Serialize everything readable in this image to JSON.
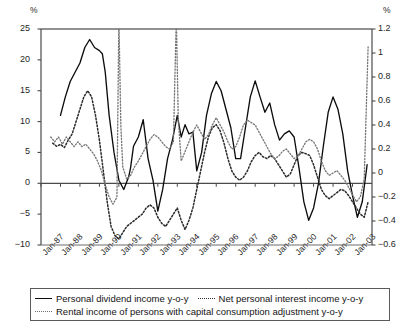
{
  "chart_data": {
    "type": "line",
    "title": "",
    "xlabel": "",
    "ylabel_left": "%",
    "ylabel_right": "%",
    "grid": false,
    "legend_position": "bottom",
    "left_axis": {
      "unit": "%",
      "min": -10,
      "max": 25,
      "step": 5,
      "ticks": [
        "25",
        "20",
        "15",
        "10",
        "5",
        "0",
        "-5",
        "-10"
      ]
    },
    "right_axis": {
      "unit": "%",
      "min": -0.6,
      "max": 1.2,
      "step": 0.2,
      "ticks": [
        "1.2",
        "1",
        "0.8",
        "0.6",
        "0.4",
        "0.2",
        "0",
        "-0.2",
        "-0.4",
        "-0.6"
      ]
    },
    "x_ticks": [
      "Jan-87",
      "Jan-88",
      "Jan-89",
      "Jan-90",
      "Jan-91",
      "Jan-92",
      "Jan-93",
      "Jan-94",
      "Jan-95",
      "Jan-96",
      "Jan-97",
      "Jan-98",
      "Jan-99",
      "Jan-00",
      "Jan-01",
      "Jan-02",
      "Jan-03"
    ],
    "x_range": [
      "Jan-87",
      "Jan-03"
    ],
    "series": [
      {
        "name": "Personal dividend income y-o-y",
        "axis": "left",
        "style": "solid",
        "color": "#0d0d0d",
        "x": [
          1988.0,
          1988.25,
          1988.5,
          1988.75,
          1989.0,
          1989.25,
          1989.5,
          1989.75,
          1990.0,
          1990.15,
          1990.3,
          1990.5,
          1990.75,
          1991.0,
          1991.25,
          1991.5,
          1991.6,
          1991.75,
          1992.0,
          1992.25,
          1992.5,
          1992.75,
          1993.0,
          1993.25,
          1993.5,
          1993.75,
          1994.0,
          1994.2,
          1994.4,
          1994.6,
          1994.8,
          1995.0,
          1995.25,
          1995.5,
          1995.75,
          1996.0,
          1996.25,
          1996.5,
          1996.75,
          1997.0,
          1997.25,
          1997.5,
          1997.75,
          1998.0,
          1998.25,
          1998.5,
          1998.75,
          1999.0,
          1999.25,
          1999.5,
          1999.75,
          2000.0,
          2000.25,
          2000.5,
          2000.75,
          2001.0,
          2001.25,
          2001.5,
          2001.75,
          2002.0,
          2002.25,
          2002.5,
          2002.75,
          2003.0,
          2003.25,
          2003.5,
          2003.75
        ],
        "values": [
          11.0,
          14.0,
          16.5,
          18.0,
          19.5,
          22.0,
          23.3,
          22.0,
          21.5,
          21.0,
          18.0,
          11.0,
          5.0,
          0.5,
          -1.0,
          1.0,
          2.5,
          6.0,
          7.5,
          10.3,
          4.0,
          0.5,
          -4.5,
          -1.0,
          4.0,
          7.0,
          11.0,
          7.5,
          9.5,
          8.0,
          8.3,
          2.0,
          5.0,
          11.0,
          14.5,
          16.5,
          15.0,
          12.0,
          9.0,
          4.0,
          4.0,
          9.0,
          14.0,
          16.6,
          14.0,
          11.5,
          13.0,
          9.5,
          7.0,
          8.0,
          8.5,
          7.5,
          2.5,
          -3.0,
          -6.0,
          -4.0,
          0.0,
          6.0,
          11.5,
          14.0,
          12.0,
          8.0,
          2.0,
          -2.0,
          -5.5,
          -3.0,
          3.0
        ]
      },
      {
        "name": "Net personal interest income y-o-y",
        "axis": "left",
        "style": "dotted-dark",
        "color": "#2b2b2b",
        "x": [
          1987.6,
          1987.8,
          1988.0,
          1988.2,
          1988.4,
          1988.6,
          1988.8,
          1989.0,
          1989.2,
          1989.4,
          1989.6,
          1989.8,
          1990.0,
          1990.2,
          1990.4,
          1990.6,
          1990.8,
          1991.0,
          1991.2,
          1991.4,
          1991.6,
          1991.8,
          1992.0,
          1992.2,
          1992.4,
          1992.6,
          1992.8,
          1993.0,
          1993.2,
          1993.4,
          1993.6,
          1993.8,
          1994.0,
          1994.2,
          1994.4,
          1994.6,
          1994.8,
          1995.0,
          1995.2,
          1995.4,
          1995.6,
          1995.8,
          1996.0,
          1996.2,
          1996.4,
          1996.6,
          1996.8,
          1997.0,
          1997.2,
          1997.4,
          1997.6,
          1997.8,
          1998.0,
          1998.2,
          1998.4,
          1998.6,
          1998.8,
          1999.0,
          1999.2,
          1999.4,
          1999.6,
          1999.8,
          2000.0,
          2000.2,
          2000.4,
          2000.6,
          2000.8,
          2001.0,
          2001.2,
          2001.4,
          2001.6,
          2001.8,
          2002.0,
          2002.2,
          2002.4,
          2002.6,
          2002.8,
          2003.0,
          2003.2,
          2003.4,
          2003.6,
          2003.8
        ],
        "values": [
          6.5,
          6.0,
          6.3,
          5.8,
          7.0,
          8.0,
          10.0,
          12.0,
          14.0,
          15.0,
          14.0,
          11.0,
          7.0,
          2.0,
          -3.0,
          -7.0,
          -8.5,
          -9.0,
          -8.0,
          -7.0,
          -6.5,
          -6.0,
          -5.5,
          -5.0,
          -4.0,
          -3.5,
          -4.0,
          -5.5,
          -6.5,
          -7.0,
          -6.0,
          -5.0,
          -4.0,
          -6.0,
          -7.5,
          -6.0,
          -4.0,
          -1.0,
          2.0,
          5.0,
          7.5,
          9.0,
          9.5,
          8.5,
          6.5,
          4.0,
          2.0,
          1.0,
          0.5,
          1.0,
          2.0,
          3.5,
          4.5,
          5.0,
          4.3,
          4.0,
          4.5,
          4.0,
          3.0,
          2.0,
          1.0,
          1.5,
          3.0,
          4.5,
          5.0,
          4.8,
          4.5,
          3.0,
          1.0,
          -1.0,
          -2.0,
          -2.5,
          -2.0,
          -1.5,
          -1.0,
          -1.2,
          -2.0,
          -3.0,
          -4.0,
          -5.0,
          -5.5,
          -3.0
        ]
      },
      {
        "name": "Rental income of persons with capital consumption adjustment y-o-y",
        "axis": "right",
        "style": "dotted-light",
        "color": "#6e6e6e",
        "x": [
          1987.5,
          1987.7,
          1987.9,
          1988.1,
          1988.3,
          1988.5,
          1988.7,
          1988.9,
          1989.1,
          1989.3,
          1989.5,
          1989.7,
          1989.9,
          1990.1,
          1990.3,
          1990.5,
          1990.7,
          1990.9,
          1991.0,
          1991.1,
          1991.2,
          1991.4,
          1991.6,
          1991.8,
          1992.0,
          1992.2,
          1992.4,
          1992.6,
          1992.8,
          1993.0,
          1993.2,
          1993.4,
          1993.6,
          1993.8,
          1993.95,
          1994.05,
          1994.2,
          1994.4,
          1994.6,
          1994.8,
          1995.0,
          1995.2,
          1995.4,
          1995.6,
          1995.8,
          1996.0,
          1996.2,
          1996.4,
          1996.6,
          1996.8,
          1997.0,
          1997.2,
          1997.4,
          1997.6,
          1997.8,
          1998.0,
          1998.2,
          1998.4,
          1998.6,
          1998.8,
          1999.0,
          1999.2,
          1999.4,
          1999.6,
          1999.8,
          2000.0,
          2000.2,
          2000.4,
          2000.6,
          2000.8,
          2001.0,
          2001.2,
          2001.4,
          2001.6,
          2001.8,
          2002.0,
          2002.2,
          2002.4,
          2002.6,
          2002.8,
          2003.0,
          2003.2,
          2003.4,
          2003.6,
          2003.8
        ],
        "values": [
          0.3,
          0.26,
          0.3,
          0.24,
          0.3,
          0.26,
          0.22,
          0.26,
          0.22,
          0.24,
          0.2,
          0.16,
          0.1,
          0.02,
          -0.1,
          -0.2,
          -0.26,
          -0.2,
          1.3,
          0.4,
          0.05,
          -0.05,
          -0.02,
          0.05,
          0.1,
          0.16,
          0.22,
          0.28,
          0.32,
          0.3,
          0.26,
          0.22,
          0.2,
          0.26,
          1.3,
          0.45,
          0.1,
          0.18,
          0.26,
          0.34,
          0.4,
          0.34,
          0.28,
          0.32,
          0.4,
          0.46,
          0.4,
          0.34,
          0.26,
          0.2,
          0.22,
          0.3,
          0.4,
          0.44,
          0.42,
          0.4,
          0.34,
          0.28,
          0.22,
          0.16,
          0.12,
          0.14,
          0.18,
          0.2,
          0.16,
          0.12,
          0.14,
          0.2,
          0.26,
          0.28,
          0.26,
          0.2,
          0.1,
          0.02,
          -0.02,
          0.0,
          0.02,
          -0.02,
          -0.06,
          -0.12,
          -0.18,
          -0.24,
          -0.2,
          -0.05,
          1.05
        ]
      }
    ]
  },
  "legend": {
    "rows": [
      [
        {
          "label": "Personal dividend income y-o-y",
          "style": "solid",
          "icon": "solid-line-icon"
        },
        {
          "label": "Net personal interest income y-o-y",
          "style": "dotted-dark",
          "icon": "dotted-line-icon"
        }
      ],
      [
        {
          "label": "Rental income of persons with capital consumption adjustment y-o-y",
          "style": "dotted-light",
          "icon": "fine-dotted-line-icon"
        }
      ]
    ]
  }
}
